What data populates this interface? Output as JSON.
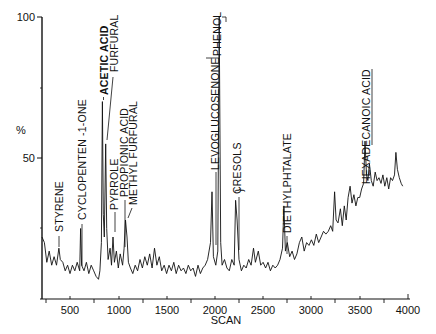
{
  "chart_data": {
    "type": "line",
    "title": "",
    "xlabel": "SCAN",
    "ylabel": "%",
    "xlim": [
      210,
      4000
    ],
    "ylim": [
      0,
      100
    ],
    "x_ticks": [
      500,
      1000,
      1500,
      2000,
      2500,
      3000,
      3500,
      4000
    ],
    "y_ticks": [
      50,
      100
    ],
    "grid": false,
    "legend": null,
    "series": [
      {
        "name": "Total ion chromatogram",
        "points": [
          [
            210,
            22
          ],
          [
            235,
            20
          ],
          [
            260,
            13
          ],
          [
            285,
            17
          ],
          [
            310,
            12
          ],
          [
            335,
            15
          ],
          [
            360,
            12
          ],
          [
            385,
            18
          ],
          [
            400,
            14
          ],
          [
            425,
            13
          ],
          [
            450,
            10
          ],
          [
            475,
            12
          ],
          [
            500,
            9
          ],
          [
            525,
            12
          ],
          [
            550,
            10
          ],
          [
            575,
            13
          ],
          [
            600,
            10
          ],
          [
            610,
            25
          ],
          [
            620,
            12
          ],
          [
            645,
            10
          ],
          [
            670,
            13
          ],
          [
            695,
            9
          ],
          [
            720,
            12
          ],
          [
            745,
            10
          ],
          [
            770,
            8
          ],
          [
            795,
            7
          ],
          [
            810,
            10
          ],
          [
            825,
            20
          ],
          [
            835,
            70
          ],
          [
            845,
            30
          ],
          [
            855,
            22
          ],
          [
            870,
            55
          ],
          [
            880,
            25
          ],
          [
            895,
            14
          ],
          [
            915,
            18
          ],
          [
            930,
            12
          ],
          [
            945,
            22
          ],
          [
            960,
            13
          ],
          [
            980,
            17
          ],
          [
            1000,
            11
          ],
          [
            1020,
            16
          ],
          [
            1045,
            12
          ],
          [
            1060,
            18
          ],
          [
            1075,
            28
          ],
          [
            1090,
            22
          ],
          [
            1105,
            13
          ],
          [
            1125,
            11
          ],
          [
            1150,
            9
          ],
          [
            1175,
            12
          ],
          [
            1200,
            10
          ],
          [
            1225,
            14
          ],
          [
            1250,
            11
          ],
          [
            1275,
            15
          ],
          [
            1300,
            12
          ],
          [
            1325,
            16
          ],
          [
            1350,
            11
          ],
          [
            1375,
            18
          ],
          [
            1400,
            12
          ],
          [
            1425,
            15
          ],
          [
            1450,
            10
          ],
          [
            1475,
            12
          ],
          [
            1500,
            9
          ],
          [
            1525,
            12
          ],
          [
            1550,
            10
          ],
          [
            1575,
            13
          ],
          [
            1600,
            9
          ],
          [
            1625,
            12
          ],
          [
            1650,
            10
          ],
          [
            1675,
            11
          ],
          [
            1700,
            9
          ],
          [
            1725,
            12
          ],
          [
            1750,
            10
          ],
          [
            1775,
            11
          ],
          [
            1800,
            8
          ],
          [
            1825,
            12
          ],
          [
            1850,
            9
          ],
          [
            1875,
            11
          ],
          [
            1900,
            12
          ],
          [
            1925,
            14
          ],
          [
            1955,
            20
          ],
          [
            1970,
            38
          ],
          [
            1985,
            15
          ],
          [
            2010,
            12
          ],
          [
            2030,
            17
          ],
          [
            2045,
            100
          ],
          [
            2060,
            20
          ],
          [
            2075,
            12
          ],
          [
            2100,
            14
          ],
          [
            2125,
            11
          ],
          [
            2150,
            10
          ],
          [
            2175,
            14
          ],
          [
            2200,
            12
          ],
          [
            2215,
            35
          ],
          [
            2230,
            28
          ],
          [
            2250,
            14
          ],
          [
            2275,
            10
          ],
          [
            2300,
            12
          ],
          [
            2325,
            11
          ],
          [
            2350,
            14
          ],
          [
            2375,
            12
          ],
          [
            2400,
            18
          ],
          [
            2420,
            13
          ],
          [
            2450,
            17
          ],
          [
            2475,
            12
          ],
          [
            2500,
            13
          ],
          [
            2525,
            11
          ],
          [
            2550,
            13
          ],
          [
            2575,
            10
          ],
          [
            2600,
            12
          ],
          [
            2625,
            11
          ],
          [
            2650,
            12
          ],
          [
            2675,
            14
          ],
          [
            2700,
            18
          ],
          [
            2715,
            33
          ],
          [
            2730,
            17
          ],
          [
            2750,
            20
          ],
          [
            2775,
            15
          ],
          [
            2800,
            17
          ],
          [
            2825,
            14
          ],
          [
            2850,
            16
          ],
          [
            2875,
            20
          ],
          [
            2900,
            22
          ],
          [
            2925,
            17
          ],
          [
            2950,
            20
          ],
          [
            2975,
            19
          ],
          [
            3000,
            21
          ],
          [
            3025,
            19
          ],
          [
            3050,
            23
          ],
          [
            3075,
            20
          ],
          [
            3100,
            22
          ],
          [
            3125,
            24
          ],
          [
            3150,
            23
          ],
          [
            3175,
            24
          ],
          [
            3200,
            26
          ],
          [
            3220,
            24
          ],
          [
            3240,
            38
          ],
          [
            3255,
            28
          ],
          [
            3275,
            27
          ],
          [
            3300,
            32
          ],
          [
            3320,
            26
          ],
          [
            3340,
            33
          ],
          [
            3360,
            28
          ],
          [
            3380,
            36
          ],
          [
            3400,
            40
          ],
          [
            3420,
            34
          ],
          [
            3440,
            37
          ],
          [
            3460,
            33
          ],
          [
            3480,
            36
          ],
          [
            3500,
            36
          ],
          [
            3520,
            39
          ],
          [
            3540,
            41
          ],
          [
            3555,
            56
          ],
          [
            3570,
            44
          ],
          [
            3585,
            42
          ],
          [
            3600,
            48
          ],
          [
            3620,
            42
          ],
          [
            3640,
            40
          ],
          [
            3660,
            45
          ],
          [
            3680,
            42
          ],
          [
            3700,
            43
          ],
          [
            3720,
            41
          ],
          [
            3740,
            44
          ],
          [
            3760,
            40
          ],
          [
            3780,
            43
          ],
          [
            3800,
            39
          ],
          [
            3820,
            43
          ],
          [
            3840,
            42
          ],
          [
            3860,
            44
          ],
          [
            3875,
            52
          ],
          [
            3890,
            46
          ],
          [
            3910,
            43
          ],
          [
            3930,
            41
          ],
          [
            3945,
            40
          ]
        ]
      }
    ],
    "annotations": [
      {
        "label": "STYRENE",
        "scan": 385,
        "value": 18
      },
      {
        "label": "CYCLOPENTEN -1-ONE",
        "scan": 610,
        "value": 25
      },
      {
        "label": "ACETIC ACID",
        "scan": 835,
        "value": 70
      },
      {
        "label": "FURFURAL",
        "scan": 870,
        "value": 55
      },
      {
        "label": "PYRROLE",
        "scan": 945,
        "value": 22
      },
      {
        "label": "PROPIONIC ACID",
        "scan": 1060,
        "value": 18
      },
      {
        "label": "METHYL FURFURAL",
        "scan": 1075,
        "value": 28
      },
      {
        "label": "LEVOGLUCOSENONE",
        "scan": 1970,
        "value": 38
      },
      {
        "label": "PHENOL",
        "scan": 2045,
        "value": 100
      },
      {
        "label": "CRESOLS",
        "scan": 2215,
        "value": 35
      },
      {
        "label": "DIETHYLPHTALATE",
        "scan": 2715,
        "value": 33
      },
      {
        "label": "HEXADECANOIC ACID",
        "scan": 3555,
        "value": 56
      }
    ]
  },
  "axes": {
    "y_label": "%",
    "y_tick_50": "50",
    "y_tick_100": "100",
    "x_label": "SCAN",
    "x_ticks": [
      "500",
      "1000",
      "1500",
      "2000",
      "2500",
      "3000",
      "3500",
      "4000"
    ]
  },
  "labels": {
    "styrene": "STYRENE",
    "cyclopentenone": "CYCLOPENTEN -1-ONE",
    "acetic_acid": "ACETIC ACID",
    "furfural": "FURFURAL",
    "pyrrole": "PYRROLE",
    "propionic_acid": "PROPIONIC ACID",
    "methyl_furfural": "METHYL FURFURAL",
    "levoglucosenone": "LEVOGLUCOSENONE",
    "phenol": "PHENOL",
    "cresols": "CRESOLS",
    "diethylphtalate": "DIETHYLPHTALATE",
    "hexadecanoic_acid": "HEXADECANOIC ACID"
  }
}
